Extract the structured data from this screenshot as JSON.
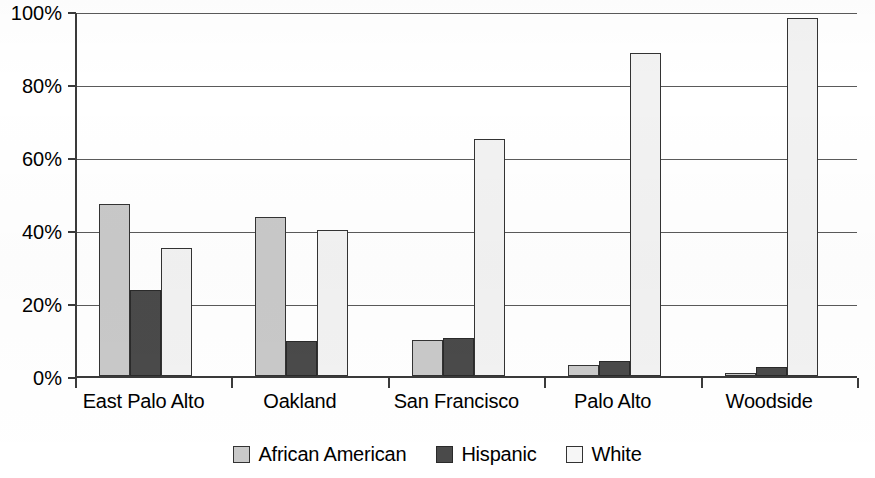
{
  "chart_data": {
    "type": "bar",
    "title": "",
    "xlabel": "",
    "ylabel": "",
    "categories": [
      "East Palo Alto",
      "Oakland",
      "San Francisco",
      "Palo Alto",
      "Woodside"
    ],
    "series": [
      {
        "name": "African American",
        "color": "#c9c9c9",
        "values": [
          47.0,
          43.5,
          10.0,
          3.0,
          0.7
        ]
      },
      {
        "name": "Hispanic",
        "color": "#4a4a4a",
        "values": [
          23.5,
          9.5,
          10.5,
          4.0,
          2.5
        ]
      },
      {
        "name": "White",
        "color": "#f2f2f2",
        "values": [
          35.0,
          40.0,
          65.0,
          88.5,
          98.0
        ]
      }
    ],
    "ylim": [
      0,
      100
    ],
    "yticks": [
      0,
      20,
      40,
      60,
      80,
      100
    ],
    "ytick_labels": [
      "0%",
      "20%",
      "40%",
      "60%",
      "80%",
      "100%"
    ],
    "grid": true,
    "grid_axis": "y",
    "legend_position": "bottom"
  },
  "axis": {
    "y_labels": [
      "100%",
      "80%",
      "60%",
      "40%",
      "20%",
      "0%"
    ]
  },
  "legend": {
    "items": [
      {
        "label": "African American",
        "swatch": "legend-swatch-african-american"
      },
      {
        "label": "Hispanic",
        "swatch": "legend-swatch-hispanic"
      },
      {
        "label": "White",
        "swatch": "legend-swatch-white"
      }
    ]
  }
}
